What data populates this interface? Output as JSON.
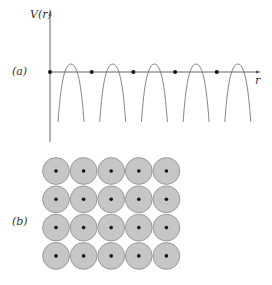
{
  "panel_a": {
    "label": "(a)",
    "y_axis_label": "V(r)",
    "x_axis_label": "r",
    "atom_count": 5,
    "well_count": 5,
    "colors": {
      "axis": "#555555",
      "curve": "#777777",
      "dot": "#111111"
    }
  },
  "panel_b": {
    "label": "(b)",
    "rows": 4,
    "columns": 5,
    "colors": {
      "fill": "#c6c6c6",
      "stroke": "#8a8a8a",
      "core": "#111111"
    }
  }
}
